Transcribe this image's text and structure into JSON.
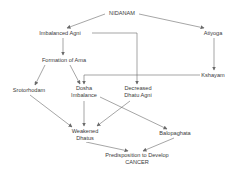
{
  "diagram": {
    "title": "NIDANAM",
    "nodes": {
      "nidanam": {
        "label": "NIDANAM"
      },
      "imbalanced_agni": {
        "label": "Imbalanced Agni"
      },
      "atiyoga": {
        "label": "Atiyoga"
      },
      "formation_of_ama": {
        "label": "Formation of Ama"
      },
      "kshayam": {
        "label": "Kshayam"
      },
      "srotorhodam": {
        "label": "Srotorhodam"
      },
      "dosha_imbalance": {
        "line1": "Dosha",
        "line2": "Imbalance"
      },
      "decreased_dhatu_agni": {
        "line1": "Decreased",
        "line2": "Dhatu Agni"
      },
      "weakened_dhatus": {
        "line1": "Weakened",
        "line2": "Dhatus"
      },
      "balopaghata": {
        "label": "Balopaghata"
      },
      "predisposition": {
        "line1": "Predisposition to Develop",
        "line2": "CANCER"
      }
    },
    "edges": [
      [
        "NIDANAM",
        "Imbalanced Agni"
      ],
      [
        "NIDANAM",
        "Atiyoga"
      ],
      [
        "Imbalanced Agni",
        "Formation of Ama"
      ],
      [
        "Imbalanced Agni",
        "Decreased Dhatu Agni"
      ],
      [
        "Atiyoga",
        "Kshayam"
      ],
      [
        "Kshayam",
        "Dosha Imbalance"
      ],
      [
        "Formation of Ama",
        "Srotorhodam"
      ],
      [
        "Formation of Ama",
        "Dosha Imbalance"
      ],
      [
        "Srotorhodam",
        "Weakened Dhatus"
      ],
      [
        "Dosha Imbalance",
        "Weakened Dhatus"
      ],
      [
        "Decreased Dhatu Agni",
        "Weakened Dhatus"
      ],
      [
        "Dosha Imbalance",
        "Balopaghata"
      ],
      [
        "Weakened Dhatus",
        "Predisposition to Develop CANCER"
      ],
      [
        "Balopaghata",
        "Predisposition to Develop CANCER"
      ]
    ],
    "colors": {
      "line": "#6a6a6a",
      "text": "#3a3a3a",
      "background": "#ffffff"
    }
  }
}
